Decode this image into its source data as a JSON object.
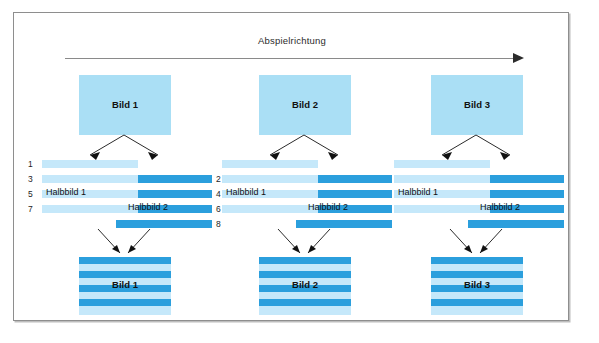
{
  "figure": {
    "title_text": "Abspielrichtung",
    "direction_arrow_icon": "arrow-right-icon",
    "background_color": "#ffffff",
    "frame_border_color": "#8e8e8e",
    "colors": {
      "light_blue": "#aadff5",
      "field_light_blue": "#c5e8fa",
      "dark_blue": "#2b9fdd",
      "text": "#111111",
      "line": "#8a8a8a"
    }
  },
  "row_numbers": {
    "odd": [
      "1",
      "3",
      "5",
      "7"
    ],
    "even": [
      "2",
      "4",
      "6",
      "8"
    ]
  },
  "field_labels": {
    "first": "Halbbild 1",
    "second": "Halbbild 2"
  },
  "groups": [
    {
      "source_label": "Bild 1",
      "result_label": "Bild 1",
      "split_arrow_icon": "split-arrows-icon",
      "merge_arrow_icon": "merge-arrows-icon"
    },
    {
      "source_label": "Bild 2",
      "result_label": "Bild 2",
      "split_arrow_icon": "split-arrows-icon",
      "merge_arrow_icon": "merge-arrows-icon"
    },
    {
      "source_label": "Bild 3",
      "result_label": "Bild 3",
      "split_arrow_icon": "split-arrows-icon",
      "merge_arrow_icon": "merge-arrows-icon"
    }
  ]
}
